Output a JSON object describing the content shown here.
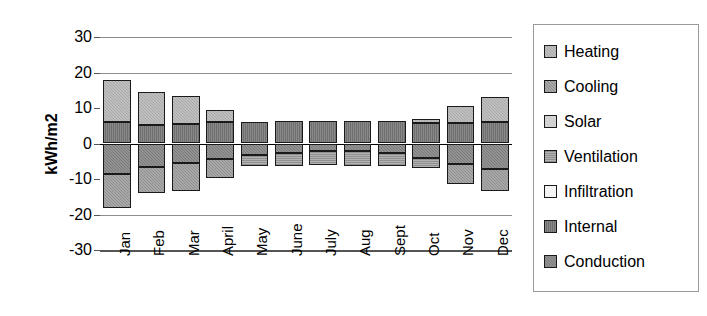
{
  "chart_data": {
    "type": "bar",
    "subtype": "stacked-bar-positive-negative",
    "title": "",
    "xlabel": "",
    "ylabel": "kWh/m2",
    "ylim": [
      -30,
      30
    ],
    "yticks": [
      30,
      20,
      10,
      0,
      -10,
      -20,
      -30
    ],
    "gridlines": [
      30,
      20,
      0,
      -20
    ],
    "grid": true,
    "legend_position": "right",
    "categories": [
      "Jan",
      "Feb",
      "Mar",
      "April",
      "May",
      "June",
      "July",
      "Aug",
      "Sept",
      "Oct",
      "Nov",
      "Dec"
    ],
    "series": [
      {
        "name": "Heating",
        "values": [
          12.0,
          9.2,
          8.0,
          3.5,
          0.0,
          0.0,
          0.0,
          0.0,
          0.0,
          1.2,
          4.7,
          7.0
        ]
      },
      {
        "name": "Internal",
        "values": [
          6.0,
          5.2,
          5.5,
          6.0,
          6.0,
          6.3,
          6.3,
          6.3,
          6.3,
          5.8,
          5.8,
          6.0
        ]
      },
      {
        "name": "Solar",
        "values": [
          0.0,
          0.0,
          0.0,
          0.0,
          0.0,
          0.0,
          0.0,
          0.0,
          0.0,
          0.0,
          0.0,
          0.0
        ]
      },
      {
        "name": "Infiltration",
        "values": [
          0.0,
          0.0,
          0.0,
          0.0,
          0.0,
          0.0,
          0.0,
          0.0,
          0.0,
          0.0,
          0.0,
          0.0
        ]
      },
      {
        "name": "Conduction",
        "values": [
          -8.5,
          -6.5,
          -5.5,
          -4.3,
          -3.3,
          -2.7,
          -2.2,
          -2.2,
          -2.6,
          -4.2,
          -5.7,
          -7.3
        ]
      },
      {
        "name": "Ventilation",
        "values": [
          0.0,
          0.0,
          0.0,
          0.0,
          -3.0,
          -3.5,
          -4.0,
          -4.2,
          -3.8,
          -2.6,
          0.0,
          0.0
        ]
      },
      {
        "name": "Cooling",
        "values": [
          -9.7,
          -7.4,
          -8.0,
          -5.3,
          0.0,
          0.0,
          0.0,
          0.0,
          0.0,
          0.0,
          -5.6,
          -6.0
        ]
      }
    ],
    "stack_totals_positive": [
      18.0,
      14.4,
      13.5,
      9.5,
      6.0,
      6.3,
      6.3,
      6.3,
      6.3,
      7.0,
      10.5,
      13.0
    ],
    "stack_totals_negative": [
      -18.2,
      -13.9,
      -13.5,
      -9.6,
      -6.3,
      -6.2,
      -6.2,
      -6.4,
      -6.4,
      -6.8,
      -11.3,
      -13.3
    ]
  },
  "axis": {
    "y_title": "kWh/m2",
    "y_tick_labels": [
      "30",
      "20",
      "10",
      "0",
      "-10",
      "-20",
      "-30"
    ],
    "x_tick_labels": [
      "Jan",
      "Feb",
      "Mar",
      "April",
      "May",
      "June",
      "July",
      "Aug",
      "Sept",
      "Oct",
      "Nov",
      "Dec"
    ]
  },
  "legend": {
    "items": [
      {
        "label": "Heating",
        "key": "heating",
        "color": "#a9a9a9"
      },
      {
        "label": "Cooling",
        "key": "cooling",
        "color": "#8f8f8f"
      },
      {
        "label": "Solar",
        "key": "solar",
        "color": "#d2d2d2"
      },
      {
        "label": "Ventilation",
        "key": "ventilation",
        "color": "#909090"
      },
      {
        "label": "Infiltration",
        "key": "infiltration",
        "color": "#f4f4f4"
      },
      {
        "label": "Internal",
        "key": "internal",
        "color": "#6f6f6f"
      },
      {
        "label": "Conduction",
        "key": "conduction",
        "color": "#7a7a7a"
      }
    ]
  },
  "colors": {
    "background": "#ffffff",
    "axis": "#555555",
    "gridline": "#8d8d8d",
    "zeroline": "#000000",
    "bar_outline": "#1a1a1a",
    "legend_border": "#9a9a9a"
  }
}
